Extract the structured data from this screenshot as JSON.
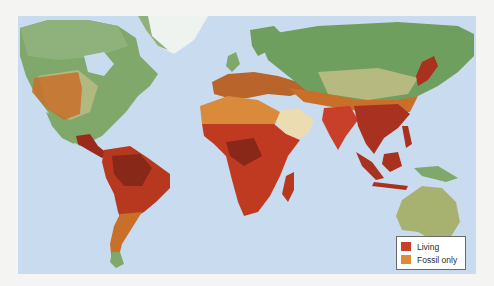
{
  "map": {
    "ocean_color": "#c9dcef",
    "colors": {
      "land_green": "#7fa86a",
      "land_dark_green": "#5f8f52",
      "land_tan": "#c8c08a",
      "ice": "#eef3f0",
      "living": "#c8402a",
      "living_dark": "#8a2a1c",
      "fossil_only": "#d98a3a"
    }
  },
  "legend": {
    "items": [
      {
        "label": "Living",
        "color": "#c8402a"
      },
      {
        "label": "Fossil only",
        "color": "#e08a38"
      }
    ]
  }
}
